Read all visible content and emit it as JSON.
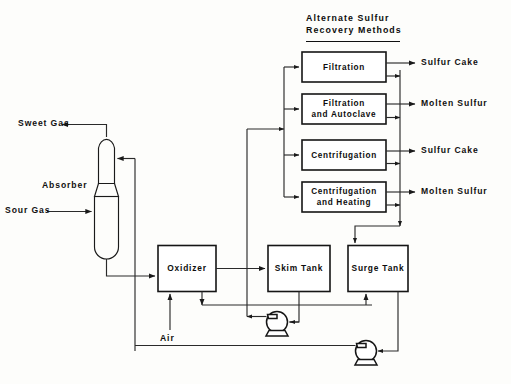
{
  "diagram": {
    "section_heading": {
      "line1": "Alternate  Sulfur",
      "line2": "Recovery  Methods"
    },
    "equipment": {
      "absorber": "Absorber",
      "oxidizer": "Oxidizer",
      "skim_tank": "Skim Tank",
      "surge_tank": "Surge Tank"
    },
    "alternate_methods": [
      {
        "id": "filtration",
        "label_line1": "Filtration",
        "label_line2": "",
        "product": "Sulfur Cake"
      },
      {
        "id": "filtration-autoclave",
        "label_line1": "Filtration",
        "label_line2": "and  Autoclave",
        "product": "Molten Sulfur"
      },
      {
        "id": "centrifugation",
        "label_line1": "Centrifugation",
        "label_line2": "",
        "product": "Sulfur Cake"
      },
      {
        "id": "centrifugation-heating",
        "label_line1": "Centrifugation",
        "label_line2": "and  Heating",
        "product": "Molten Sulfur"
      }
    ],
    "streams": {
      "sweet_gas": "Sweet Gas",
      "sour_gas": "Sour  Gas",
      "air": "Air",
      "product_1": "Sulfur Cake",
      "product_2": "Molten Sulfur",
      "product_3": "Sulfur Cake",
      "product_4": "Molten Sulfur"
    },
    "pumps": [
      {
        "id": "pump-skim",
        "name": "skim-tank-pump"
      },
      {
        "id": "pump-surge",
        "name": "surge-tank-pump"
      }
    ],
    "colors": {
      "line": "#1a1a1a",
      "text": "#101010",
      "background": "#fdfdfb"
    }
  }
}
